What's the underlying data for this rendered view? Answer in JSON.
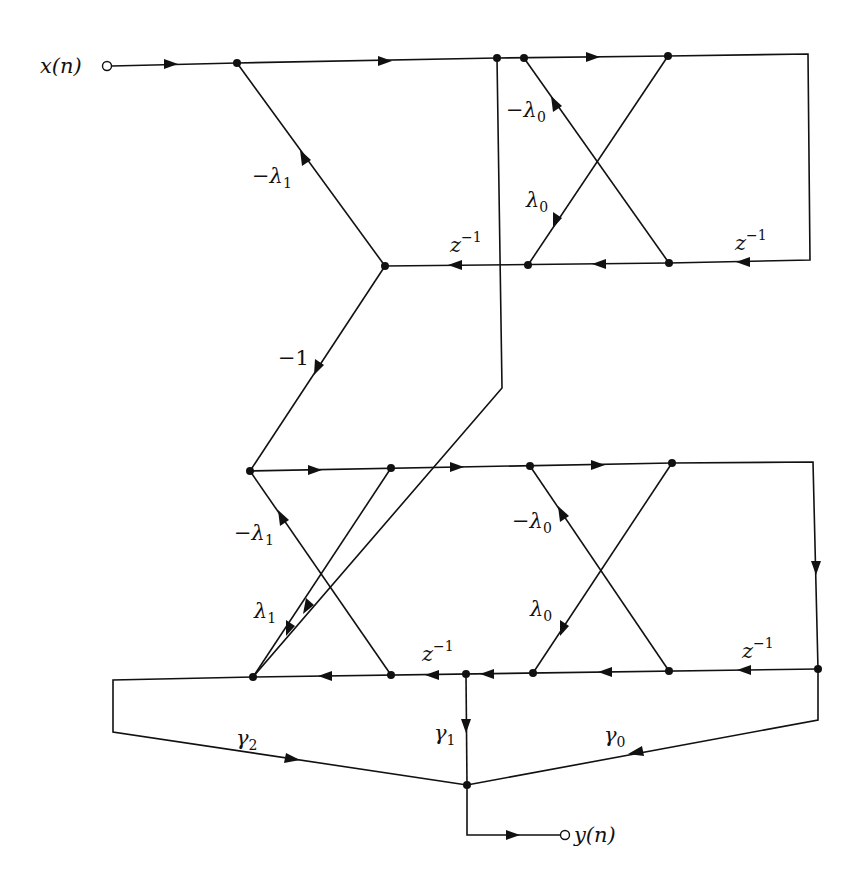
{
  "diagram": {
    "type": "signal-flow-graph",
    "input_label": "x(n)",
    "output_label": "y(n)",
    "stages": [
      {
        "name": "stage-1",
        "gains": {
          "forward_cross": "−λ1",
          "backward_cross": "λ1",
          "delay": "z−1"
        }
      },
      {
        "name": "stage-0",
        "gains": {
          "forward_cross": "−λ0",
          "backward_cross": "λ0",
          "delay": "z−1"
        }
      }
    ],
    "connector_gain": "−1",
    "ladder_gains": [
      "γ2",
      "γ1",
      "γ0"
    ]
  },
  "labels": {
    "x_n": "x(n)",
    "y_n": "y(n)",
    "top_neg_lambda1": {
      "main": "−λ",
      "sub": "1"
    },
    "top_neg_lambda0": {
      "main": "−λ",
      "sub": "0"
    },
    "top_lambda0": {
      "main": "λ",
      "sub": "0"
    },
    "top_z_left": {
      "main": "z",
      "sup": "−1"
    },
    "top_z_right": {
      "main": "z",
      "sup": "−1"
    },
    "minus_one": "−1",
    "bot_neg_lambda1": {
      "main": "−λ",
      "sub": "1"
    },
    "bot_lambda1": {
      "main": "λ",
      "sub": "1"
    },
    "bot_neg_lambda0": {
      "main": "−λ",
      "sub": "0"
    },
    "bot_lambda0": {
      "main": "λ",
      "sub": "0"
    },
    "bot_z_left": {
      "main": "z",
      "sup": "−1"
    },
    "bot_z_right": {
      "main": "z",
      "sup": "−1"
    },
    "gamma2": {
      "main": "γ",
      "sub": "2"
    },
    "gamma1": {
      "main": "γ",
      "sub": "1"
    },
    "gamma0": {
      "main": "γ",
      "sub": "0"
    }
  }
}
